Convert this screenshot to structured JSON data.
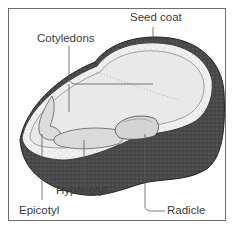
{
  "diagram": {
    "labels": {
      "seed_coat": "Seed coat",
      "cotyledons": "Cotyledons",
      "hypocotyl": "Hypocotyl",
      "epicotyl": "Epicotyl",
      "radicle": "Radicle"
    },
    "colors": {
      "seed_coat": "#3c3c3c",
      "seed_coat_side": "#555555",
      "cotyledon": "#e9e9e9",
      "embryo": "#dcdcdc",
      "leader_line": "#555555",
      "frame": "#6e6e6e",
      "text": "#3a3a3a"
    }
  }
}
